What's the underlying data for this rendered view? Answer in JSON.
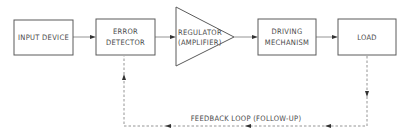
{
  "diagram": {
    "type": "block-diagram",
    "blocks": [
      {
        "id": "input",
        "lines": [
          "INPUT DEVICE"
        ]
      },
      {
        "id": "error",
        "lines": [
          "ERROR",
          "DETECTOR"
        ]
      },
      {
        "id": "regulator",
        "shape": "triangle",
        "lines": [
          "REGULATOR",
          "(AMPLIFIER)"
        ]
      },
      {
        "id": "driving",
        "lines": [
          "DRIVING",
          "MECHANISM"
        ]
      },
      {
        "id": "load",
        "lines": [
          "LOAD"
        ]
      }
    ],
    "feedback_label": "FEEDBACK LOOP (FOLLOW-UP)"
  }
}
